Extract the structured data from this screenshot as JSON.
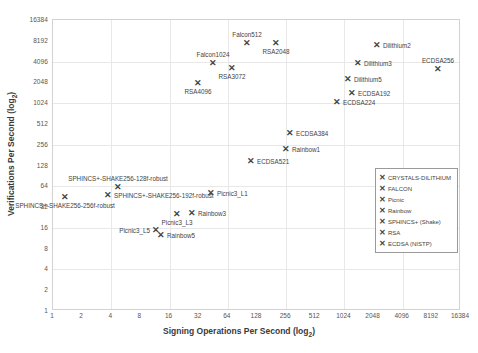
{
  "chart_data": {
    "type": "scatter",
    "title": "",
    "xlabel": "Signing Operations Per Second (log2)",
    "ylabel": "Verifications Per Second (log2)",
    "xlabel_base": "Signing Operations Per Second (log",
    "ylabel_base": "Verifications Per Second (log",
    "label_sub": "2",
    "label_tail": ")",
    "xscale": "log2",
    "yscale": "log2",
    "xlim": [
      1,
      16384
    ],
    "ylim": [
      1,
      16384
    ],
    "grid": true,
    "xticks": [
      "1",
      "2",
      "4",
      "8",
      "16",
      "32",
      "64",
      "128",
      "256",
      "512",
      "1024",
      "2048",
      "4096",
      "8192",
      "16384"
    ],
    "yticks": [
      "16384",
      "8192",
      "4096",
      "2048",
      "1024",
      "512",
      "256",
      "128",
      "64",
      "32",
      "16",
      "8",
      "4",
      "2",
      "1"
    ],
    "marker": "✕",
    "marker_color": "#444444",
    "legend_position": "right-middle",
    "legend": [
      {
        "name": "CRYSTALS-DILITHIUM"
      },
      {
        "name": "FALCON"
      },
      {
        "name": "Picnic"
      },
      {
        "name": "Rainbow"
      },
      {
        "name": "SPHINCS+ (Shake)"
      },
      {
        "name": "RSA"
      },
      {
        "name": "ECDSA (NISTP)"
      }
    ],
    "points": [
      {
        "label": "Falcon512",
        "series": "FALCON",
        "x": 790,
        "y": 6100,
        "lx": 246,
        "ly": 42,
        "pos": "above"
      },
      {
        "label": "RSA2048",
        "series": "RSA",
        "x": 1900,
        "y": 6100,
        "lx": 275,
        "ly": 42,
        "pos": "below"
      },
      {
        "label": "Falcon1024",
        "series": "FALCON",
        "x": 340,
        "y": 3400,
        "lx": 212,
        "ly": 62,
        "pos": "above"
      },
      {
        "label": "RSA3072",
        "series": "RSA",
        "x": 560,
        "y": 2900,
        "lx": 231,
        "ly": 67,
        "pos": "below"
      },
      {
        "label": "RSA4096",
        "series": "RSA",
        "x": 195,
        "y": 2000,
        "lx": 197,
        "ly": 82,
        "pos": "below"
      },
      {
        "label": "Dilithium2",
        "series": "CRYSTALS-DILITHIUM",
        "x": 5200,
        "y": 5600,
        "lx": 376,
        "ly": 44,
        "pos": "right"
      },
      {
        "label": "ECDSA256",
        "series": "ECDSA (NISTP)",
        "x": 11500,
        "y": 3000,
        "lx": 437,
        "ly": 68,
        "pos": "above"
      },
      {
        "label": "Dilithium3",
        "series": "CRYSTALS-DILITHIUM",
        "x": 3000,
        "y": 3200,
        "lx": 357,
        "ly": 62,
        "pos": "right"
      },
      {
        "label": "Dilithium5",
        "series": "CRYSTALS-DILITHIUM",
        "x": 2100,
        "y": 2100,
        "lx": 347,
        "ly": 78,
        "pos": "right"
      },
      {
        "label": "ECDSA192",
        "series": "ECDSA (NISTP)",
        "x": 2500,
        "y": 1400,
        "lx": 351,
        "ly": 92,
        "pos": "right"
      },
      {
        "label": "ECDSA224",
        "series": "ECDSA (NISTP)",
        "x": 1500,
        "y": 1100,
        "lx": 336,
        "ly": 101,
        "pos": "right"
      },
      {
        "label": "ECDSA384",
        "series": "ECDSA (NISTP)",
        "x": 300,
        "y": 400,
        "lx": 289,
        "ly": 132,
        "pos": "right"
      },
      {
        "label": "Rainbow1",
        "series": "Rainbow",
        "x": 260,
        "y": 240,
        "lx": 285,
        "ly": 148,
        "pos": "right"
      },
      {
        "label": "ECDSA521",
        "series": "ECDSA (NISTP)",
        "x": 100,
        "y": 170,
        "lx": 250,
        "ly": 160,
        "pos": "right"
      },
      {
        "label": "SPHINCS+-SHAKE256-128f-robust",
        "series": "SPHINCS+ (Shake)",
        "x": 18,
        "y": 68,
        "lx": 117,
        "ly": 186,
        "pos": "above"
      },
      {
        "label": "SPHINCS+-SHAKE256-192f-robust",
        "series": "SPHINCS+ (Shake)",
        "x": 12,
        "y": 56,
        "lx": 107,
        "ly": 194,
        "pos": "right"
      },
      {
        "label": "SPHINCS+-SHAKE256-256f-robust",
        "series": "SPHINCS+ (Shake)",
        "x": 2.6,
        "y": 44,
        "lx": 64,
        "ly": 196,
        "pos": "below"
      },
      {
        "label": "Picnic3_L1",
        "series": "Picnic",
        "x": 120,
        "y": 52,
        "lx": 210,
        "ly": 192,
        "pos": "right"
      },
      {
        "label": "Rainbow3",
        "series": "Rainbow",
        "x": 70,
        "y": 24,
        "lx": 191,
        "ly": 212,
        "pos": "right"
      },
      {
        "label": "Picnic3_L3",
        "series": "Picnic",
        "x": 50,
        "y": 24,
        "lx": 176,
        "ly": 213,
        "pos": "below"
      },
      {
        "label": "Picnic3_L5",
        "series": "Picnic",
        "x": 22,
        "y": 15,
        "lx": 155,
        "ly": 229,
        "pos": "left"
      },
      {
        "label": "Rainbow5",
        "series": "Rainbow",
        "x": 27,
        "y": 14,
        "lx": 160,
        "ly": 234,
        "pos": "right"
      }
    ]
  }
}
